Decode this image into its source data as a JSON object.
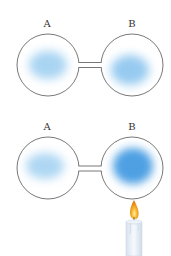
{
  "diagram": {
    "panels": [
      {
        "id": "top",
        "labels": {
          "left": "A",
          "right": "B"
        },
        "heated": false
      },
      {
        "id": "bottom",
        "labels": {
          "left": "A",
          "right": "B"
        },
        "heated": true
      }
    ],
    "colors": {
      "outline": "#555555",
      "gas_light": "#8cc6ee",
      "gas_dense": "#3a96e0",
      "flame": "#f2a31c",
      "candle": "#e6eef6"
    }
  }
}
